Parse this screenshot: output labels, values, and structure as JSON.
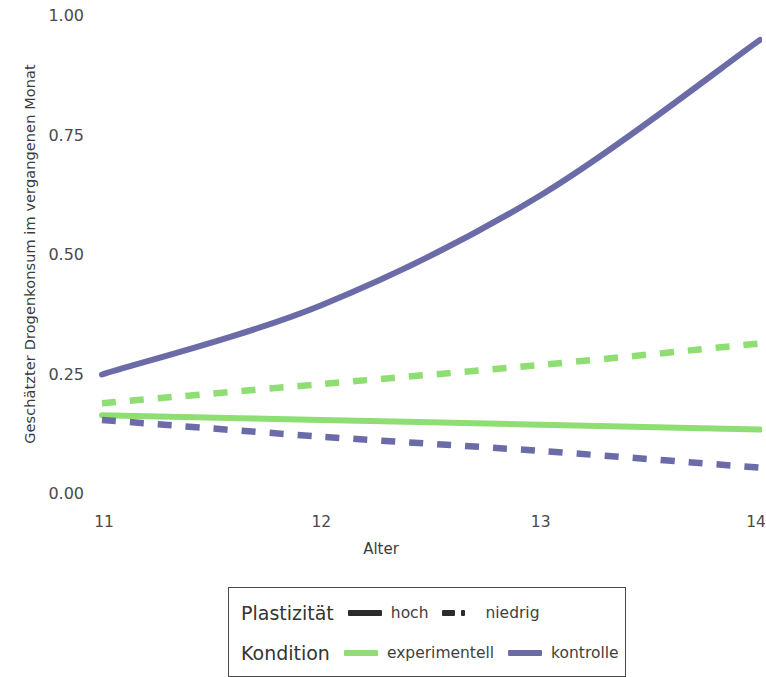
{
  "chart_data": {
    "type": "line",
    "title": "",
    "xlabel": "Alter",
    "ylabel": "Geschätzter Drogenkonsum im vergangenen Monat",
    "x": [
      11,
      12,
      13,
      14
    ],
    "xlim": [
      11,
      14
    ],
    "ylim": [
      0.0,
      1.0
    ],
    "xticks": [
      "11",
      "12",
      "13",
      "14"
    ],
    "yticks": [
      "0.00",
      "0.25",
      "0.50",
      "0.75",
      "1.00"
    ],
    "grid": false,
    "legend_position": "bottom",
    "series": [
      {
        "name": "kontrolle / hoch",
        "kondition": "kontrolle",
        "plastizitaet": "hoch",
        "style": "solid",
        "color": "#6b6ba8",
        "values": [
          0.25,
          0.395,
          0.625,
          0.95
        ]
      },
      {
        "name": "experimentell / niedrig",
        "kondition": "experimentell",
        "plastizitaet": "niedrig",
        "style": "dashed",
        "color": "#8ede74",
        "values": [
          0.19,
          0.23,
          0.27,
          0.315
        ]
      },
      {
        "name": "experimentell / hoch",
        "kondition": "experimentell",
        "plastizitaet": "hoch",
        "style": "solid",
        "color": "#8ede74",
        "values": [
          0.165,
          0.155,
          0.145,
          0.135
        ]
      },
      {
        "name": "kontrolle / niedrig",
        "kondition": "kontrolle",
        "plastizitaet": "niedrig",
        "style": "dashed",
        "color": "#6b6ba8",
        "values": [
          0.155,
          0.12,
          0.09,
          0.055
        ]
      }
    ]
  },
  "axes": {
    "y_title": "Geschätzter Drogenkonsum im vergangenen Monat",
    "x_title": "Alter",
    "y_ticks": [
      {
        "label": "1.00",
        "value": 1.0
      },
      {
        "label": "0.75",
        "value": 0.75
      },
      {
        "label": "0.50",
        "value": 0.5
      },
      {
        "label": "0.25",
        "value": 0.25
      },
      {
        "label": "0.00",
        "value": 0.0
      }
    ],
    "x_ticks": [
      {
        "label": "11",
        "value": 11
      },
      {
        "label": "12",
        "value": 12
      },
      {
        "label": "13",
        "value": 13
      },
      {
        "label": "14",
        "value": 14
      }
    ]
  },
  "legend": {
    "rows": [
      {
        "title": "Plastizität",
        "entries": [
          {
            "label": "hoch",
            "style": "solid",
            "color": "#2b2b2b"
          },
          {
            "label": "niedrig",
            "style": "dashed",
            "color": "#2b2b2b"
          }
        ]
      },
      {
        "title": "Kondition",
        "entries": [
          {
            "label": "experimentell",
            "style": "solid",
            "color": "#8ede74"
          },
          {
            "label": "kontrolle",
            "style": "solid",
            "color": "#6b6ba8"
          }
        ]
      }
    ]
  },
  "colors": {
    "experimentell": "#8ede74",
    "kontrolle": "#6b6ba8",
    "legend_key": "#2b2b2b",
    "text": "#3c3c3c",
    "background": "#ffffff"
  }
}
